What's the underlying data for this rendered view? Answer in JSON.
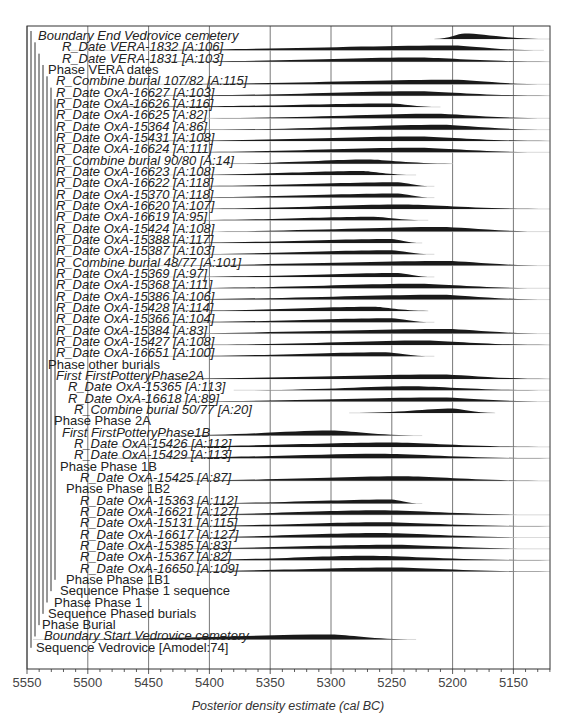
{
  "chart_data": {
    "type": "area",
    "title": "",
    "xlabel": "Posterior density estimate (cal BC)",
    "ylabel": "",
    "x_axis": {
      "ticks": [
        5550,
        5500,
        5450,
        5400,
        5350,
        5300,
        5250,
        5200,
        5150
      ],
      "range": [
        5550,
        5120
      ],
      "reversed": true,
      "minor_tick_step": 10
    },
    "grid": true,
    "legend": null,
    "rows": [
      {
        "label": "Boundary End Vedrovice cemetery",
        "italic": true,
        "indent": 0,
        "dist": [
          5215,
          5190,
          5120,
          0.6
        ]
      },
      {
        "label": "R_Date VERA-1832 [A:106]",
        "italic": true,
        "indent": 3,
        "dist": [
          5515,
          5200,
          5125,
          0.55
        ]
      },
      {
        "label": "R_Date VERA-1831 [A:103]",
        "italic": true,
        "indent": 3,
        "dist": [
          5450,
          5230,
          5120,
          0.45
        ]
      },
      {
        "label": "Phase VERA dates",
        "italic": false,
        "indent": 2,
        "dist": null
      },
      {
        "label": "R_Combine burial 107/82 [A:115]",
        "italic": true,
        "indent": 2,
        "dist": [
          5470,
          5200,
          5120,
          0.5
        ]
      },
      {
        "label": "R_Date OxA-16627 [A:103]",
        "italic": true,
        "indent": 2,
        "dist": [
          5450,
          5230,
          5120,
          0.5
        ]
      },
      {
        "label": "R_Date OxA-16626 [A:116]",
        "italic": true,
        "indent": 2,
        "dist": [
          5480,
          5250,
          5210,
          0.4
        ]
      },
      {
        "label": "R_Date OxA-16625 [A:82]",
        "italic": true,
        "indent": 2,
        "dist": [
          5420,
          5215,
          5120,
          0.5
        ]
      },
      {
        "label": "R_Date OxA-15364 [A:86]",
        "italic": true,
        "indent": 2,
        "dist": [
          5420,
          5210,
          5120,
          0.55
        ]
      },
      {
        "label": "R_Date OxA-15431 [A:108]",
        "italic": true,
        "indent": 2,
        "dist": [
          5460,
          5230,
          5120,
          0.5
        ]
      },
      {
        "label": "R_Date OxA-16624 [A:111]",
        "italic": true,
        "indent": 2,
        "dist": [
          5450,
          5230,
          5120,
          0.5
        ]
      },
      {
        "label": "R_Combine burial 90/80 [A:14]",
        "italic": true,
        "indent": 2,
        "dist": [
          5400,
          5270,
          5200,
          0.45
        ]
      },
      {
        "label": "R_Date OxA-16623 [A:108]",
        "italic": true,
        "indent": 2,
        "dist": [
          5440,
          5275,
          5230,
          0.45
        ]
      },
      {
        "label": "R_Date OxA-16622 [A:118]",
        "italic": true,
        "indent": 2,
        "dist": [
          5450,
          5245,
          5215,
          0.45
        ]
      },
      {
        "label": "R_Date OxA-15370 [A:118]",
        "italic": true,
        "indent": 2,
        "dist": [
          5450,
          5245,
          5215,
          0.45
        ]
      },
      {
        "label": "R_Date OxA-16620 [A:107]",
        "italic": true,
        "indent": 2,
        "dist": [
          5440,
          5240,
          5120,
          0.5
        ]
      },
      {
        "label": "R_Date OxA-16619 [A:95]",
        "italic": true,
        "indent": 2,
        "dist": [
          5440,
          5265,
          5220,
          0.4
        ]
      },
      {
        "label": "R_Date OxA-15424 [A:108]",
        "italic": true,
        "indent": 2,
        "dist": [
          5430,
          5210,
          5120,
          0.5
        ]
      },
      {
        "label": "R_Date OxA-15388 [A:117]",
        "italic": true,
        "indent": 2,
        "dist": [
          5450,
          5250,
          5225,
          0.45
        ]
      },
      {
        "label": "R_Date OxA-15387 [A:103]",
        "italic": true,
        "indent": 2,
        "dist": [
          5450,
          5250,
          5215,
          0.45
        ]
      },
      {
        "label": "R_Combine burial 48/77 [A:101]",
        "italic": true,
        "indent": 2,
        "dist": [
          5480,
          5205,
          5120,
          0.5
        ]
      },
      {
        "label": "R_Date OxA-15369 [A:97]",
        "italic": true,
        "indent": 2,
        "dist": [
          5440,
          5245,
          5215,
          0.45
        ]
      },
      {
        "label": "R_Date OxA-15368 [A:111]",
        "italic": true,
        "indent": 2,
        "dist": [
          5440,
          5230,
          5120,
          0.5
        ]
      },
      {
        "label": "R_Date OxA-15386 [A:106]",
        "italic": true,
        "indent": 2,
        "dist": [
          5470,
          5210,
          5120,
          0.55
        ]
      },
      {
        "label": "R_Date OxA-15428 [A:114]",
        "italic": true,
        "indent": 2,
        "dist": [
          5440,
          5265,
          5220,
          0.45
        ]
      },
      {
        "label": "R_Date OxA-15366 [A:104]",
        "italic": true,
        "indent": 2,
        "dist": [
          5450,
          5250,
          5215,
          0.45
        ]
      },
      {
        "label": "R_Date OxA-15384 [A:83]",
        "italic": true,
        "indent": 2,
        "dist": [
          5480,
          5205,
          5120,
          0.5
        ]
      },
      {
        "label": "R_Date OxA-15427 [A:108]",
        "italic": true,
        "indent": 2,
        "dist": [
          5430,
          5225,
          5120,
          0.5
        ]
      },
      {
        "label": "R_Date OxA-16651 [A:100]",
        "italic": true,
        "indent": 2,
        "dist": [
          5450,
          5255,
          5215,
          0.45
        ]
      },
      {
        "label": "Phase other burials",
        "italic": false,
        "indent": 2,
        "dist": null
      },
      {
        "label": "First FirstPotteryPhase2A",
        "italic": true,
        "indent": 3,
        "dist": [
          5480,
          5210,
          5120,
          0.5
        ]
      },
      {
        "label": "R_Date OxA-15365 [A:113]",
        "italic": true,
        "indent": 4,
        "dist": [
          5380,
          5235,
          5120,
          0.45
        ]
      },
      {
        "label": "R_Date OxA-16618 [A:89]",
        "italic": true,
        "indent": 4,
        "dist": [
          5460,
          5210,
          5120,
          0.45
        ]
      },
      {
        "label": "R_Combine burial 50/77 [A:20]",
        "italic": true,
        "indent": 5,
        "dist": [
          5285,
          5200,
          5165,
          0.5
        ]
      },
      {
        "label": "Phase Phase 2A",
        "italic": false,
        "indent": 3,
        "dist": null
      },
      {
        "label": "First FirstPotteryPhase1B",
        "italic": true,
        "indent": 4,
        "dist": [
          5440,
          5300,
          5225,
          0.55
        ]
      },
      {
        "label": "R_Date OxA-15426 [A:112]",
        "italic": true,
        "indent": 5,
        "dist": [
          5480,
          5250,
          5120,
          0.5
        ]
      },
      {
        "label": "R_Date OxA-15429 [A:113]",
        "italic": true,
        "indent": 5,
        "dist": [
          5480,
          5260,
          5120,
          0.5
        ]
      },
      {
        "label": "Phase Phase 1B",
        "italic": false,
        "indent": 4,
        "dist": null
      },
      {
        "label": "R_Date OxA-15425 [A:87]",
        "italic": true,
        "indent": 6,
        "dist": [
          5460,
          5240,
          5120,
          0.5
        ]
      },
      {
        "label": "Phase Phase 1B2",
        "italic": false,
        "indent": 5,
        "dist": null
      },
      {
        "label": "R_Date OxA-15363 [A:112]",
        "italic": true,
        "indent": 6,
        "dist": [
          5440,
          5250,
          5225,
          0.45
        ]
      },
      {
        "label": "R_Date OxA-16621 [A:127]",
        "italic": true,
        "indent": 6,
        "dist": [
          5450,
          5260,
          5120,
          0.5
        ]
      },
      {
        "label": "R_Date OxA-15131 [A:115]",
        "italic": true,
        "indent": 6,
        "dist": [
          5450,
          5260,
          5120,
          0.45
        ]
      },
      {
        "label": "R_Date OxA-16617 [A:127]",
        "italic": true,
        "indent": 6,
        "dist": [
          5450,
          5260,
          5120,
          0.5
        ]
      },
      {
        "label": "R_Date OxA-15385 [A:83]",
        "italic": true,
        "indent": 6,
        "dist": [
          5470,
          5250,
          5120,
          0.45
        ]
      },
      {
        "label": "R_Date OxA-15367 [A:82]",
        "italic": true,
        "indent": 6,
        "dist": [
          5440,
          5270,
          5120,
          0.5
        ]
      },
      {
        "label": "R_Date OxA-16650 [A:109]",
        "italic": true,
        "indent": 6,
        "dist": [
          5460,
          5250,
          5120,
          0.45
        ]
      },
      {
        "label": "Phase Phase 1B1",
        "italic": false,
        "indent": 5,
        "dist": null
      },
      {
        "label": "Sequence Phase 1 sequence",
        "italic": false,
        "indent": 4,
        "dist": null
      },
      {
        "label": "Phase Phase 1",
        "italic": false,
        "indent": 3,
        "dist": null
      },
      {
        "label": "Sequence Phased burials",
        "italic": false,
        "indent": 2,
        "dist": null
      },
      {
        "label": "Phase Burial",
        "italic": false,
        "indent": 1,
        "dist": null
      },
      {
        "label": "Boundary Start Vedrovice cemetery",
        "italic": true,
        "indent": 1,
        "dist": [
          5545,
          5300,
          5230,
          0.55
        ]
      },
      {
        "label": "Sequence Vedrovice [Amodel:74]",
        "italic": false,
        "indent": 0,
        "dist": null
      }
    ]
  },
  "layout": {
    "plot_left": 27,
    "plot_right": 550,
    "plot_top": 26,
    "plot_bottom": 669,
    "x_min_year": 5550,
    "px_per_year": 1.216,
    "row_top": 36,
    "row_step": 11.33
  }
}
